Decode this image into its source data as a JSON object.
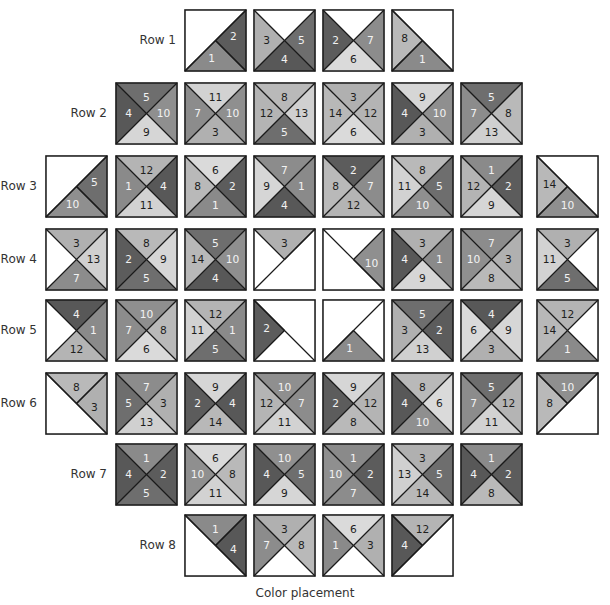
{
  "caption": "Color placement",
  "shades": {
    "1": "#8a8a8a",
    "2": "#5c5c5c",
    "3": "#b0b0b0",
    "4": "#585858",
    "5": "#6e6e6e",
    "6": "#dadada",
    "7": "#8c8c8c",
    "8": "#b9b9b9",
    "9": "#d6d6d6",
    "10": "#8f8f8f",
    "11": "#d2d2d2",
    "12": "#b4b4b4",
    "13": "#d0d0d0",
    "14": "#b8b8b8"
  },
  "light_text_numbers": [
    1,
    2,
    4,
    5,
    7,
    10
  ],
  "rows": [
    {
      "label": "Row 1",
      "start_col": 2,
      "blocks": [
        {
          "top": null,
          "left": null,
          "right": 2,
          "bottom": 1,
          "diag": "bl-tr"
        },
        {
          "top": null,
          "left": 3,
          "right": 5,
          "bottom": 4
        },
        {
          "top": null,
          "left": 2,
          "right": 7,
          "bottom": 6
        },
        {
          "top": null,
          "left": 8,
          "right": null,
          "bottom": 1,
          "diag": "tl-br"
        }
      ]
    },
    {
      "label": "Row 2",
      "start_col": 1,
      "blocks": [
        {
          "top": 5,
          "left": 4,
          "right": 10,
          "bottom": 9
        },
        {
          "top": 11,
          "left": 7,
          "right": 10,
          "bottom": 3
        },
        {
          "top": 8,
          "left": 12,
          "right": 13,
          "bottom": 5
        },
        {
          "top": 3,
          "left": 14,
          "right": 12,
          "bottom": 6
        },
        {
          "top": 9,
          "left": 4,
          "right": 10,
          "bottom": 3
        },
        {
          "top": 5,
          "left": 7,
          "right": 8,
          "bottom": 13
        }
      ]
    },
    {
      "label": "Row 3",
      "start_col": 0,
      "blocks": [
        {
          "top": null,
          "left": null,
          "right": 5,
          "bottom": 10,
          "diag": "bl-tr"
        },
        {
          "top": 12,
          "left": 1,
          "right": 4,
          "bottom": 11
        },
        {
          "top": 6,
          "left": 8,
          "right": 2,
          "bottom": 1
        },
        {
          "top": 7,
          "left": 9,
          "right": 1,
          "bottom": 4
        },
        {
          "top": 2,
          "left": 8,
          "right": 7,
          "bottom": 12
        },
        {
          "top": 8,
          "left": 11,
          "right": 5,
          "bottom": 10
        },
        {
          "top": 1,
          "left": 12,
          "right": 2,
          "bottom": 9
        },
        {
          "top": null,
          "left": 14,
          "right": null,
          "bottom": 10,
          "diag": "tl-br"
        }
      ]
    },
    {
      "label": "Row 4",
      "start_col": 0,
      "blocks": [
        {
          "top": 3,
          "left": null,
          "right": 13,
          "bottom": 7
        },
        {
          "top": 8,
          "left": 2,
          "right": 9,
          "bottom": 5
        },
        {
          "top": 5,
          "left": 14,
          "right": 10,
          "bottom": 4
        },
        {
          "top": 3,
          "left": null,
          "right": null,
          "bottom": null,
          "diag": "bl-tr"
        },
        {
          "top": null,
          "left": null,
          "right": 10,
          "bottom": null,
          "diag": "tl-br"
        },
        {
          "top": 3,
          "left": 4,
          "right": 1,
          "bottom": 9
        },
        {
          "top": 7,
          "left": 10,
          "right": 3,
          "bottom": 8
        },
        {
          "top": 3,
          "left": 11,
          "right": null,
          "bottom": 5
        }
      ]
    },
    {
      "label": "Row 5",
      "start_col": 0,
      "blocks": [
        {
          "top": 4,
          "left": null,
          "right": 1,
          "bottom": 12
        },
        {
          "top": 10,
          "left": 7,
          "right": 8,
          "bottom": 6
        },
        {
          "top": 12,
          "left": 11,
          "right": 1,
          "bottom": 5
        },
        {
          "top": null,
          "left": 2,
          "right": null,
          "bottom": null,
          "diag": "tl-br"
        },
        {
          "top": null,
          "left": null,
          "right": null,
          "bottom": 1,
          "diag": "bl-tr"
        },
        {
          "top": 5,
          "left": 3,
          "right": 2,
          "bottom": 13
        },
        {
          "top": 4,
          "left": 6,
          "right": 9,
          "bottom": 3
        },
        {
          "top": 12,
          "left": 14,
          "right": null,
          "bottom": 1
        }
      ]
    },
    {
      "label": "Row 6",
      "start_col": 0,
      "blocks": [
        {
          "top": 8,
          "left": null,
          "right": 3,
          "bottom": null,
          "diag": "tl-br"
        },
        {
          "top": 7,
          "left": 5,
          "right": 3,
          "bottom": 13
        },
        {
          "top": 9,
          "left": 2,
          "right": 4,
          "bottom": 14
        },
        {
          "top": 10,
          "left": 12,
          "right": 7,
          "bottom": 11
        },
        {
          "top": 9,
          "left": 2,
          "right": 12,
          "bottom": 8
        },
        {
          "top": 8,
          "left": 4,
          "right": 6,
          "bottom": 10
        },
        {
          "top": 5,
          "left": 7,
          "right": 12,
          "bottom": 11
        },
        {
          "top": 10,
          "left": 8,
          "right": null,
          "bottom": null,
          "diag": "bl-tr"
        }
      ]
    },
    {
      "label": "Row 7",
      "start_col": 1,
      "blocks": [
        {
          "top": 1,
          "left": 4,
          "right": 2,
          "bottom": 5
        },
        {
          "top": 6,
          "left": 10,
          "right": 8,
          "bottom": 11
        },
        {
          "top": 10,
          "left": 4,
          "right": 5,
          "bottom": 9
        },
        {
          "top": 1,
          "left": 10,
          "right": 2,
          "bottom": 7
        },
        {
          "top": 3,
          "left": 13,
          "right": 5,
          "bottom": 14
        },
        {
          "top": 1,
          "left": 4,
          "right": 2,
          "bottom": 8
        }
      ]
    },
    {
      "label": "Row 8",
      "start_col": 2,
      "blocks": [
        {
          "top": 1,
          "left": null,
          "right": 4,
          "bottom": null,
          "diag": "tl-br"
        },
        {
          "top": 3,
          "left": 7,
          "right": 8,
          "bottom": null
        },
        {
          "top": 6,
          "left": 1,
          "right": 3,
          "bottom": null
        },
        {
          "top": 12,
          "left": 4,
          "right": null,
          "bottom": null,
          "diag": "bl-tr"
        }
      ]
    }
  ]
}
